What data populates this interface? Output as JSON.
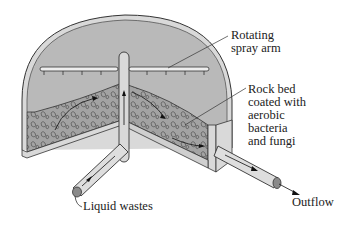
{
  "diagram": {
    "labels": {
      "spray_arm": "Rotating\nspray arm",
      "rock_bed": "Rock bed\ncoated with\naerobic\nbacteria\nand fungi",
      "inflow": "Liquid wastes",
      "outflow": "Outflow"
    },
    "components": [
      "tank-wall",
      "central-pipe",
      "rotating-spray-arm",
      "spray-nozzles",
      "rock-bed",
      "inflow-pipe",
      "outflow-pipe",
      "flow-arrows"
    ],
    "colors": {
      "background": "#ffffff",
      "tank_interior": "#b9b9b9",
      "tank_wall": "#d6d6d6",
      "rock_bed": "#9e9e9e",
      "pipe": "#d9d9d9",
      "outline": "#333333",
      "text": "#222222"
    }
  }
}
